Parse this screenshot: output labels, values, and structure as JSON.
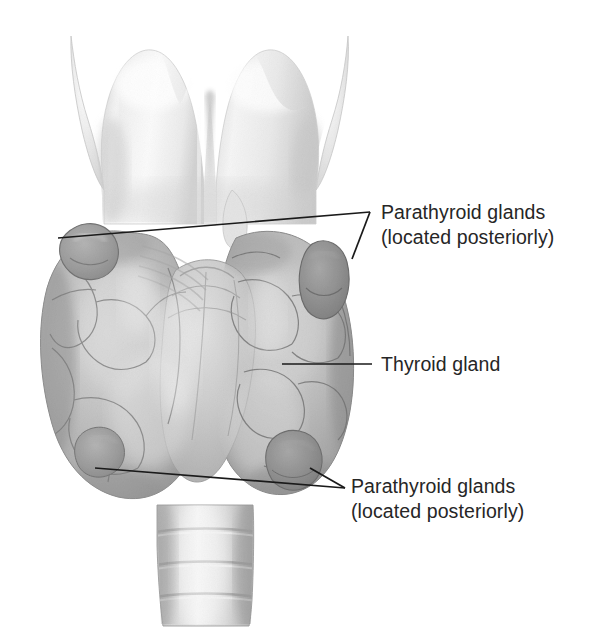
{
  "figure": {
    "type": "anatomical-illustration",
    "style": "grayscale-airbrush",
    "background_color": "#ffffff",
    "width": 594,
    "height": 634
  },
  "labels": [
    {
      "id": "parathyroid-superior",
      "line1": "Parathyroid glands",
      "line2": "(located posteriorly)",
      "text_color": "#262626",
      "leader_lines": [
        {
          "from_x": 58,
          "from_y": 238,
          "to_x": 370,
          "to_y": 212
        },
        {
          "from_x": 370,
          "from_y": 212,
          "to_x": 352,
          "to_y": 259
        }
      ]
    },
    {
      "id": "thyroid",
      "line1": "Thyroid gland",
      "line2": "",
      "text_color": "#262626",
      "leader_lines": [
        {
          "from_x": 282,
          "from_y": 364,
          "to_x": 372,
          "to_y": 364
        }
      ]
    },
    {
      "id": "parathyroid-inferior",
      "line1": "Parathyroid glands",
      "line2": "(located posteriorly)",
      "text_color": "#262626",
      "leader_lines": [
        {
          "from_x": 95,
          "from_y": 468,
          "to_x": 345,
          "to_y": 488
        },
        {
          "from_x": 310,
          "from_y": 468,
          "to_x": 345,
          "to_y": 488
        }
      ]
    }
  ],
  "structures": {
    "thyroid_cartilage": {
      "name": "Thyroid cartilage (larynx)",
      "tone": "#f2f2f2",
      "bounds": [
        70,
        28,
        290,
        215
      ]
    },
    "thyroid_gland": {
      "name": "Thyroid gland",
      "tone": "#b9b9b9",
      "bounds": [
        42,
        212,
        320,
        290
      ]
    },
    "trachea": {
      "name": "Trachea",
      "tone": "#dcdcdc",
      "bounds": [
        148,
        500,
        110,
        125
      ],
      "ring_count": 4
    },
    "parathyroid_glands": [
      {
        "position": "superior-left",
        "cx": 88,
        "cy": 250,
        "rx": 26,
        "ry": 22,
        "tone": "#9a9a9a"
      },
      {
        "position": "superior-right",
        "cx": 326,
        "cy": 266,
        "rx": 22,
        "ry": 28,
        "tone": "#8e8e8e"
      },
      {
        "position": "inferior-left",
        "cx": 103,
        "cy": 447,
        "rx": 22,
        "ry": 19,
        "tone": "#9c9c9c"
      },
      {
        "position": "inferior-right",
        "cx": 296,
        "cy": 455,
        "rx": 24,
        "ry": 22,
        "tone": "#9a9a9a"
      }
    ]
  }
}
